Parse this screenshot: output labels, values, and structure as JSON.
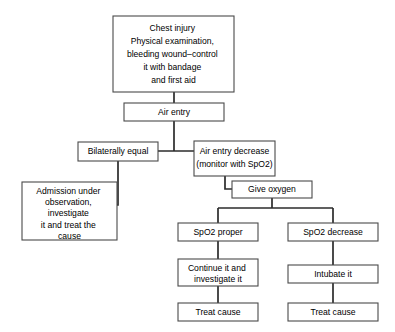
{
  "diagram": {
    "background_color": "#ffffff",
    "box_fill_color": "#ffffff",
    "box_border_color": "#4a4a4a",
    "connector_color": "#2b2b2b",
    "text_color": "#000000"
  },
  "nodes": {
    "chest_injury": {
      "lines": [
        "Chest injury",
        "Physical examination,",
        "bleeding wound–control",
        "it with bandage",
        "and first aid"
      ]
    },
    "air_entry": {
      "lines": [
        "Air entry"
      ]
    },
    "bilaterally_equal": {
      "lines": [
        "Bilaterally equal"
      ]
    },
    "air_entry_decrease": {
      "lines": [
        "Air entry decrease",
        "(monitor with SpO2)"
      ],
      "line1": "Air entry decrease",
      "line2_prefix": "(monitor with SpO",
      "line2_sub": "2",
      "line2_suffix": ")"
    },
    "admission": {
      "lines": [
        "Admission under",
        "observation,",
        "investigate",
        "it and treat the",
        "cause"
      ]
    },
    "give_oxygen": {
      "lines": [
        "Give oxygen"
      ]
    },
    "spo2_proper": {
      "prefix": "SpO",
      "sub": "2",
      "suffix": " proper"
    },
    "spo2_decrease": {
      "prefix": "SpO",
      "sub": "2",
      "suffix": " decrease"
    },
    "continue_investigate": {
      "lines": [
        "Continue it and",
        "investigate it"
      ]
    },
    "intubate": {
      "lines": [
        "Intubate it"
      ]
    },
    "treat_cause_left": {
      "lines": [
        "Treat cause"
      ]
    },
    "treat_cause_right": {
      "lines": [
        "Treat cause"
      ]
    }
  }
}
